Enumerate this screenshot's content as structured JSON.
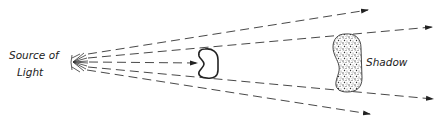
{
  "diagram": {
    "labels": {
      "source_line1": "Source of",
      "source_line2": "Light",
      "shadow": "Shadow"
    },
    "elements": {
      "source": {
        "name": "Source of Light",
        "x": 73,
        "y": 62
      },
      "object": {
        "name": "opaque object",
        "shape": "kidney/bean outline",
        "x": [
          198,
          218
        ],
        "y": [
          49,
          78
        ]
      },
      "shadow": {
        "name": "Shadow",
        "shape": "stippled bean shape",
        "x": [
          333,
          362
        ],
        "y": [
          34,
          92
        ]
      }
    },
    "rays": [
      {
        "id": "ray-top",
        "from": [
          75,
          56
        ],
        "to": [
          368,
          10
        ]
      },
      {
        "id": "ray-upper-tangent",
        "from": [
          75,
          59
        ],
        "to": [
          432,
          27
        ]
      },
      {
        "id": "ray-center",
        "from": [
          77,
          63
        ],
        "to": [
          197,
          63
        ]
      },
      {
        "id": "ray-lower-tangent",
        "from": [
          75,
          67
        ],
        "to": [
          433,
          99
        ]
      },
      {
        "id": "ray-bottom",
        "from": [
          75,
          70
        ],
        "to": [
          370,
          114
        ]
      }
    ],
    "colors": {
      "ink": "#333333",
      "background": "#ffffff"
    }
  }
}
